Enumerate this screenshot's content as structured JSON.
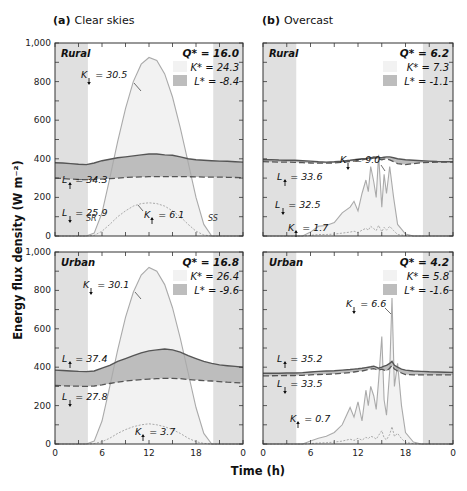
{
  "chart_data": {
    "type": "line",
    "ylabel": "Energy flux density (W m⁻²)",
    "xlabel": "Time (h)",
    "xlim": [
      0,
      24
    ],
    "ylim": [
      0,
      1000
    ],
    "xticks": [
      0,
      6,
      12,
      18,
      0
    ],
    "yticks": [
      "0",
      "200",
      "400",
      "600",
      "800",
      "1,000"
    ],
    "night_shading": {
      "before_h": 4.2,
      "after_h": 20.2,
      "color": "#e0e0e0"
    },
    "colors": {
      "K_down_fill": "#f2f2f2",
      "L_fill": "#bdbdbd",
      "K_line": "#aaaaaa",
      "L_up_line": "#555555",
      "L_down_line": "#555555",
      "K_up_line": "#aaaaaa"
    },
    "columns": [
      {
        "title_prefix": "(a)",
        "title": "Clear skies"
      },
      {
        "title_prefix": "(b)",
        "title": "Overcast"
      }
    ],
    "panels": [
      {
        "id": "clear-rural",
        "site": "Rural",
        "sky": "clear",
        "Q_star": "Q* = 16.0",
        "K_star": "K* = 24.3",
        "L_star": "L* = -8.4",
        "annotations": {
          "K_down": "= 30.5",
          "L_up": "= 34.3",
          "L_down": "= 25.9",
          "K_up": "= 6.1",
          "SR": "SR",
          "SS": "SS"
        },
        "series": {
          "x": [
            0,
            1,
            2,
            3,
            4,
            5,
            6,
            7,
            8,
            9,
            10,
            11,
            12,
            13,
            14,
            15,
            16,
            17,
            18,
            19,
            20,
            21,
            22,
            23,
            24
          ],
          "K_down": [
            0,
            0,
            0,
            0,
            0,
            15,
            120,
            300,
            490,
            660,
            800,
            890,
            925,
            910,
            840,
            720,
            560,
            380,
            200,
            60,
            0,
            0,
            0,
            0,
            0
          ],
          "K_up": [
            0,
            0,
            0,
            0,
            0,
            3,
            25,
            60,
            100,
            130,
            155,
            168,
            172,
            168,
            155,
            130,
            100,
            60,
            25,
            5,
            0,
            0,
            0,
            0,
            0
          ],
          "L_up": [
            380,
            378,
            375,
            372,
            370,
            378,
            390,
            398,
            405,
            410,
            415,
            420,
            425,
            425,
            420,
            418,
            410,
            400,
            395,
            392,
            390,
            388,
            387,
            385,
            383
          ],
          "L_down": [
            300,
            298,
            295,
            293,
            292,
            293,
            295,
            297,
            300,
            303,
            305,
            306,
            307,
            307,
            308,
            308,
            308,
            307,
            306,
            305,
            305,
            305,
            304,
            303,
            302
          ]
        }
      },
      {
        "id": "overcast-rural",
        "site": "Rural",
        "sky": "overcast",
        "Q_star": "Q* = 6.2",
        "K_star": "K* = 7.3",
        "L_star": "L* = -1.1",
        "annotations": {
          "K_down": "= 9.0",
          "L_up": "= 33.6",
          "L_down": "= 32.5",
          "K_up": "= 1.7"
        },
        "series": {
          "x": [
            0,
            1,
            2,
            3,
            4,
            5,
            6,
            7,
            8,
            9,
            10,
            11,
            11.5,
            12,
            12.5,
            13,
            13.3,
            13.6,
            14,
            14.3,
            14.6,
            15,
            15.3,
            15.6,
            16,
            16.5,
            17,
            17.5,
            18,
            19,
            20,
            21,
            22,
            23,
            24
          ],
          "K_down": [
            0,
            0,
            0,
            0,
            0,
            0,
            20,
            50,
            55,
            70,
            120,
            150,
            180,
            130,
            220,
            290,
            230,
            360,
            280,
            200,
            420,
            150,
            320,
            220,
            360,
            200,
            60,
            35,
            10,
            0,
            0,
            0,
            0,
            0,
            0
          ],
          "K_up": [
            0,
            0,
            0,
            0,
            0,
            0,
            3,
            8,
            8,
            10,
            15,
            20,
            25,
            18,
            30,
            40,
            30,
            50,
            38,
            28,
            55,
            22,
            45,
            30,
            50,
            28,
            8,
            5,
            2,
            0,
            0,
            0,
            0,
            0,
            0
          ],
          "L_up": [
            395,
            396,
            394,
            393,
            392,
            390,
            388,
            385,
            383,
            385,
            388,
            392,
            395,
            398,
            400,
            402,
            404,
            405,
            410,
            408,
            406,
            405,
            408,
            410,
            410,
            405,
            400,
            398,
            395,
            392,
            390,
            388,
            386,
            385,
            385
          ],
          "L_down": [
            385,
            384,
            383,
            383,
            382,
            380,
            378,
            377,
            377,
            379,
            382,
            386,
            388,
            392,
            395,
            398,
            399,
            400,
            405,
            402,
            400,
            395,
            398,
            400,
            395,
            385,
            375,
            372,
            370,
            375,
            380,
            382,
            383,
            383,
            383
          ]
        }
      },
      {
        "id": "clear-urban",
        "site": "Urban",
        "sky": "clear",
        "Q_star": "Q* = 16.8",
        "K_star": "K* = 26.4",
        "L_star": "L* = -9.6",
        "annotations": {
          "K_down": "= 30.1",
          "L_up": "= 37.4",
          "L_down": "= 27.8",
          "K_up": "= 3.7"
        },
        "series": {
          "x": [
            0,
            1,
            2,
            3,
            4,
            5,
            6,
            7,
            8,
            9,
            10,
            11,
            12,
            13,
            14,
            15,
            16,
            17,
            18,
            19,
            20,
            21,
            22,
            23,
            24
          ],
          "K_down": [
            0,
            0,
            0,
            0,
            0,
            15,
            120,
            300,
            490,
            660,
            790,
            880,
            920,
            900,
            830,
            710,
            550,
            370,
            190,
            55,
            0,
            0,
            0,
            0,
            0
          ],
          "K_up": [
            0,
            0,
            0,
            0,
            0,
            2,
            12,
            30,
            55,
            75,
            90,
            100,
            105,
            100,
            90,
            75,
            55,
            30,
            12,
            3,
            0,
            0,
            0,
            0,
            0
          ],
          "L_up": [
            385,
            383,
            380,
            378,
            377,
            380,
            395,
            410,
            430,
            445,
            460,
            475,
            485,
            490,
            495,
            490,
            478,
            460,
            445,
            430,
            420,
            412,
            408,
            404,
            400
          ],
          "L_down": [
            305,
            303,
            302,
            301,
            300,
            302,
            308,
            315,
            322,
            328,
            332,
            335,
            338,
            340,
            342,
            342,
            340,
            336,
            333,
            330,
            328,
            325,
            322,
            320,
            318
          ]
        }
      },
      {
        "id": "overcast-urban",
        "site": "Urban",
        "sky": "overcast",
        "Q_star": "Q* = 4.2",
        "K_star": "K* = 5.8",
        "L_star": "L* = -1.6",
        "annotations": {
          "K_down": "= 6.6",
          "L_up": "= 35.2",
          "L_down": "= 33.5",
          "K_up": "= 0.7"
        },
        "series": {
          "x": [
            0,
            1,
            2,
            3,
            4,
            5,
            6,
            7,
            8,
            9,
            10,
            11,
            11.5,
            12,
            12.5,
            13,
            13.3,
            13.6,
            14,
            14.3,
            14.6,
            15,
            15.3,
            15.6,
            16,
            16.3,
            16.6,
            17,
            17.5,
            18,
            19,
            20,
            21,
            22,
            23,
            24
          ],
          "K_down": [
            0,
            0,
            0,
            0,
            0,
            0,
            15,
            30,
            40,
            60,
            100,
            190,
            140,
            220,
            120,
            280,
            200,
            300,
            250,
            180,
            330,
            560,
            230,
            150,
            380,
            760,
            300,
            420,
            200,
            60,
            10,
            0,
            0,
            0,
            0,
            0
          ],
          "K_up": [
            0,
            0,
            0,
            0,
            0,
            0,
            2,
            5,
            7,
            10,
            15,
            25,
            18,
            30,
            20,
            35,
            28,
            40,
            35,
            25,
            45,
            70,
            32,
            22,
            50,
            90,
            40,
            55,
            28,
            8,
            2,
            0,
            0,
            0,
            0,
            0
          ],
          "L_up": [
            368,
            368,
            369,
            370,
            370,
            372,
            375,
            378,
            380,
            382,
            385,
            388,
            390,
            392,
            395,
            398,
            400,
            402,
            405,
            400,
            395,
            400,
            405,
            410,
            420,
            430,
            410,
            400,
            390,
            385,
            380,
            378,
            376,
            375,
            374,
            373
          ],
          "L_down": [
            355,
            355,
            356,
            357,
            357,
            358,
            360,
            362,
            363,
            365,
            368,
            372,
            375,
            378,
            380,
            385,
            388,
            390,
            392,
            388,
            385,
            390,
            385,
            380,
            395,
            410,
            390,
            380,
            370,
            362,
            360,
            360,
            360,
            360,
            360,
            360
          ]
        }
      }
    ]
  }
}
